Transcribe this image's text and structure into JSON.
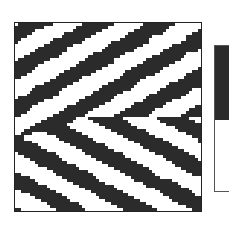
{
  "chart_data": {
    "type": "heatmap",
    "title": "",
    "xlabel": "",
    "ylabel": "",
    "grid": false,
    "legend_position": "right",
    "colormap": [
      {
        "label": "",
        "color": "#2b2b2b",
        "fraction": 0.51
      },
      {
        "label": "",
        "color": "#ffffff",
        "fraction": 0.49
      }
    ],
    "grid_size": [
      64,
      64
    ],
    "pattern": {
      "description": "binary field of diagonal streaks; upper half streaks run lower-left to upper-right, lower half streaks run upper-left to lower-right, forming a chevron near the middle-left",
      "upper_angle_deg": 30,
      "lower_angle_deg": -28,
      "stripe_period": 11,
      "dark_fraction": 0.5,
      "noise": 0.18,
      "seed": 7
    }
  },
  "colors": {
    "dark": "#2b2b2b",
    "light": "#ffffff",
    "frame": "#222222"
  }
}
